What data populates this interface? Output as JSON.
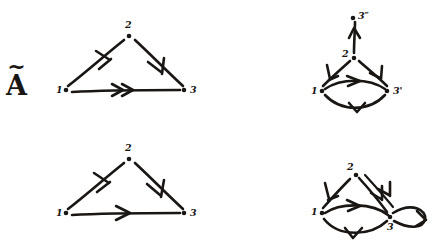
{
  "figure": {
    "background_color": "#ffffff",
    "ink_color": "#1a1613",
    "panel_count": 4
  },
  "panels": [
    {
      "id": "panel-a-tilde",
      "label": "A",
      "label_accent": "~",
      "label_full": "Ã",
      "position": "top-left",
      "graph": {
        "vertices": [
          {
            "id": "v1",
            "label": "1",
            "x": 62,
            "y": 90
          },
          {
            "id": "v2",
            "label": "2",
            "x": 129,
            "y": 33
          },
          {
            "id": "v3",
            "label": "3",
            "x": 188,
            "y": 90
          }
        ],
        "edges": [
          {
            "from": "1",
            "to": "2",
            "multiplicity": 1,
            "style": "straight",
            "arrowheads": 1
          },
          {
            "from": "2",
            "to": "3",
            "multiplicity": 1,
            "style": "straight",
            "arrowheads": 1
          },
          {
            "from": "1",
            "to": "3",
            "multiplicity": 2,
            "style": "straight",
            "arrowheads": 2
          }
        ]
      }
    },
    {
      "id": "panel-a",
      "label": "A",
      "label_accent": "",
      "label_full": "A",
      "position": "bottom-left",
      "graph": {
        "vertices": [
          {
            "id": "v1",
            "label": "1",
            "x": 62,
            "y": 90
          },
          {
            "id": "v2",
            "label": "2",
            "x": 129,
            "y": 33
          },
          {
            "id": "v3",
            "label": "3",
            "x": 188,
            "y": 90
          }
        ],
        "edges": [
          {
            "from": "1",
            "to": "2",
            "multiplicity": 1,
            "style": "straight",
            "arrowheads": 1
          },
          {
            "from": "2",
            "to": "3",
            "multiplicity": 1,
            "style": "straight",
            "arrowheads": 1
          },
          {
            "from": "1",
            "to": "3",
            "multiplicity": 1,
            "style": "straight",
            "arrowheads": 1
          }
        ]
      }
    },
    {
      "id": "panel-b-tilde",
      "label": "B",
      "label_accent": "~",
      "label_full": "B̃",
      "position": "top-right",
      "graph": {
        "vertices": [
          {
            "id": "v1",
            "label": "1",
            "x": 96,
            "y": 91
          },
          {
            "id": "v2",
            "label": "2",
            "x": 131,
            "y": 57
          },
          {
            "id": "v3p",
            "label": "3'",
            "x": 168,
            "y": 91
          },
          {
            "id": "v3pp",
            "label": "3″",
            "x": 142,
            "y": 16
          }
        ],
        "edges": [
          {
            "from": "2",
            "to": "3″",
            "multiplicity": 1,
            "style": "straight-vertical",
            "arrowheads": 1
          },
          {
            "from": "2",
            "to": "1",
            "multiplicity": 1,
            "style": "straight",
            "arrowheads": 1
          },
          {
            "from": "2",
            "to": "3'",
            "multiplicity": 1,
            "style": "straight",
            "arrowheads": 1
          },
          {
            "from": "1",
            "to": "3'",
            "multiplicity": 1,
            "style": "curve-up",
            "arrowheads": 1
          },
          {
            "from": "3'",
            "to": "1",
            "multiplicity": 1,
            "style": "curve-down",
            "arrowheads": 1
          }
        ]
      }
    },
    {
      "id": "panel-b",
      "label": "B",
      "label_accent": "",
      "label_full": "B",
      "position": "bottom-right",
      "graph": {
        "vertices": [
          {
            "id": "v1",
            "label": "1",
            "x": 96,
            "y": 91
          },
          {
            "id": "v2",
            "label": "2",
            "x": 131,
            "y": 52
          },
          {
            "id": "v3",
            "label": "3",
            "x": 168,
            "y": 95
          }
        ],
        "edges": [
          {
            "from": "2",
            "to": "1",
            "multiplicity": 1,
            "style": "straight",
            "arrowheads": 1
          },
          {
            "from": "2",
            "to": "3",
            "multiplicity": 2,
            "style": "straight-double",
            "arrowheads": 2
          },
          {
            "from": "1",
            "to": "3",
            "multiplicity": 1,
            "style": "curve-up",
            "arrowheads": 1
          },
          {
            "from": "3",
            "to": "1",
            "multiplicity": 1,
            "style": "curve-down",
            "arrowheads": 1
          },
          {
            "from": "3",
            "to": "3",
            "multiplicity": 1,
            "style": "self-loop",
            "arrowheads": 1
          }
        ]
      }
    }
  ]
}
